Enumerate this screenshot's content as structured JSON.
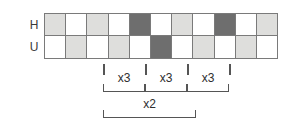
{
  "diagram": {
    "rows": [
      {
        "label": "H",
        "name": "row-h",
        "cells": [
          "light",
          "white",
          "light",
          "white",
          "dark",
          "white",
          "light",
          "white",
          "dark",
          "white",
          "light"
        ]
      },
      {
        "label": "U",
        "name": "row-u",
        "cells": [
          "white",
          "light",
          "white",
          "light",
          "white",
          "dark",
          "white",
          "light",
          "white",
          "light",
          "white"
        ]
      }
    ],
    "column_count": 11,
    "colors": {
      "white": "#ffffff",
      "light": "#dededc",
      "dark": "#6e6e6e",
      "stroke": "#7a7a7a",
      "annotation": "#555555",
      "text": "#2e2e2e"
    },
    "ticks": [
      {
        "name": "tick-1",
        "x": 103
      },
      {
        "name": "tick-2",
        "x": 145
      },
      {
        "name": "tick-3",
        "x": 187
      },
      {
        "name": "tick-4",
        "x": 229
      }
    ],
    "brackets": [
      {
        "name": "bracket-x3-first",
        "label": "x3",
        "left": 103,
        "width": 42,
        "top": 84
      },
      {
        "name": "bracket-x3-second",
        "label": "x3",
        "left": 145,
        "width": 42,
        "top": 84
      },
      {
        "name": "bracket-x3-third",
        "label": "x3",
        "left": 187,
        "width": 42,
        "top": 84
      },
      {
        "name": "bracket-x2",
        "label": "x2",
        "left": 103,
        "width": 93,
        "top": 110
      }
    ]
  }
}
